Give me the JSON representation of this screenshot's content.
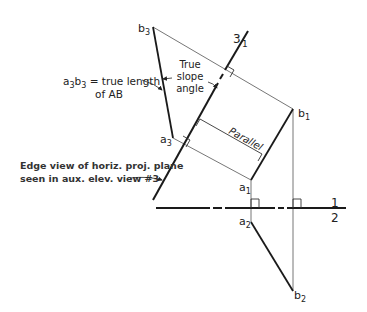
{
  "diagram": {
    "points": {
      "b3": {
        "label": "b",
        "sub": "3"
      },
      "a3": {
        "label": "a",
        "sub": "3"
      },
      "b1": {
        "label": "b",
        "sub": "1"
      },
      "a1": {
        "label": "a",
        "sub": "1"
      },
      "a2": {
        "label": "a",
        "sub": "2"
      },
      "b2": {
        "label": "b",
        "sub": "2"
      }
    },
    "fold_lines": {
      "aux": {
        "top": "3",
        "bottom": "1"
      },
      "main": {
        "top": "1",
        "bottom": "2"
      }
    },
    "annotations": {
      "true_length": {
        "line1_prefix": "a",
        "sub1": "3",
        "mid": "b",
        "sub2": "3",
        "line1_suffix": " = true length",
        "line2": "of AB"
      },
      "slope": {
        "line1": "True",
        "line2": "slope",
        "line3": "angle"
      },
      "parallel": "Parallel",
      "edge_view": {
        "line1": "Edge view of horiz. proj. plane",
        "line2": "seen in aux. elev. view #3"
      }
    },
    "colors": {
      "stroke": "#1a1a1a",
      "thin": "#555555",
      "background": "#ffffff"
    }
  }
}
